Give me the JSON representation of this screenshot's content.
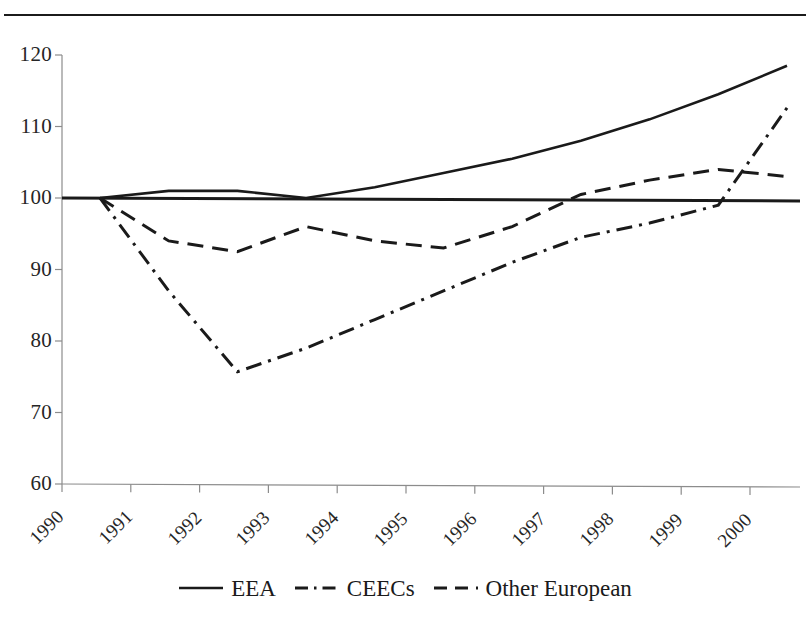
{
  "chart_data": {
    "type": "line",
    "title": "",
    "subtitle": "",
    "xlabel": "",
    "ylabel": "",
    "categories": [
      "1990",
      "1991",
      "1992",
      "1993",
      "1994",
      "1995",
      "1996",
      "1997",
      "1998",
      "1999",
      "2000"
    ],
    "ylim": [
      60,
      120
    ],
    "yticks": [
      60,
      70,
      80,
      90,
      100,
      110,
      120
    ],
    "ytick_labels": [
      "60",
      "70",
      "80",
      "90",
      "100",
      "110",
      "120"
    ],
    "grid": false,
    "legend_position": "bottom",
    "reference_line": 100,
    "series": [
      {
        "name": "EEA",
        "style": "solid",
        "color": "#1a1a1a",
        "values": [
          100,
          101,
          101,
          100,
          101.5,
          103.5,
          105.5,
          108,
          111,
          114.5,
          118.5
        ]
      },
      {
        "name": "CEECs",
        "style": "dash-dot",
        "color": "#1a1a1a",
        "values": [
          100,
          87,
          75.7,
          79,
          83,
          87,
          91,
          94.5,
          96.5,
          99,
          112.6
        ]
      },
      {
        "name": "Other European",
        "style": "dashed",
        "color": "#1a1a1a",
        "values": [
          100,
          94,
          92.5,
          96,
          94,
          93,
          96,
          100.5,
          102.5,
          104,
          103
        ]
      }
    ]
  },
  "figure": {
    "top_rule": "horizontal-rule",
    "axis_color": "#8c8c8c",
    "line_color": "#1a1a1a"
  },
  "legend": {
    "items": [
      {
        "label": "EEA",
        "key": "solid-line-key"
      },
      {
        "label": "CEECs",
        "key": "dash-dot-line-key"
      },
      {
        "label": "Other European",
        "key": "dashed-line-key"
      }
    ]
  }
}
